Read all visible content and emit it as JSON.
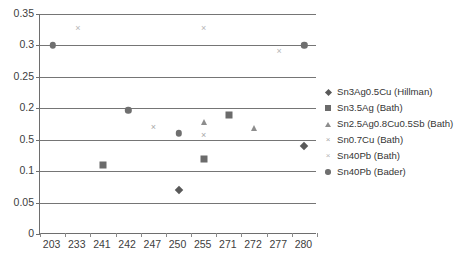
{
  "chart_data": {
    "type": "scatter",
    "title": "",
    "xlabel": "",
    "ylabel": "",
    "categories": [
      "203",
      "233",
      "241",
      "242",
      "247",
      "250",
      "255",
      "271",
      "272",
      "277",
      "280"
    ],
    "ylim": [
      0,
      0.35
    ],
    "ytick_labels": [
      "0.35",
      "0.3",
      "0.25",
      "0.2",
      "0.5",
      "0.1",
      "0.05",
      "0"
    ],
    "ytick_values": [
      0.35,
      0.3,
      0.25,
      0.2,
      0.15,
      0.1,
      0.05,
      0
    ],
    "grid": true,
    "legend_position": "right",
    "series": [
      {
        "name": "Sn3Ag0.5Cu (Hillman)",
        "marker": "diamond",
        "color": "#595959",
        "points": [
          {
            "x": "250",
            "y": 0.07
          },
          {
            "x": "280",
            "y": 0.14
          }
        ]
      },
      {
        "name": "Sn3.5Ag (Bath)",
        "marker": "square",
        "color": "#6b6b6b",
        "points": [
          {
            "x": "241",
            "y": 0.11
          },
          {
            "x": "255",
            "y": 0.12
          },
          {
            "x": "271",
            "y": 0.189
          }
        ]
      },
      {
        "name": "Sn2.5Ag0.8Cu0.5Sb (Bath)",
        "marker": "triangle",
        "color": "#8d8d8d",
        "points": [
          {
            "x": "255",
            "y": 0.178
          },
          {
            "x": "272",
            "y": 0.168
          }
        ]
      },
      {
        "name": "Sn0.7Cu (Bath)",
        "marker": "cross",
        "color": "#a8a8a8",
        "points": [
          {
            "x": "247",
            "y": 0.171
          },
          {
            "x": "255",
            "y": 0.158
          }
        ]
      },
      {
        "name": "Sn40Pb (Bath)",
        "marker": "cross-light",
        "color": "#b5b5b5",
        "points": [
          {
            "x": "233",
            "y": 0.328
          },
          {
            "x": "255",
            "y": 0.328
          },
          {
            "x": "277",
            "y": 0.291
          }
        ]
      },
      {
        "name": "Sn40Pb (Bader)",
        "marker": "circle",
        "color": "#6f6f6f",
        "points": [
          {
            "x": "203",
            "y": 0.3
          },
          {
            "x": "242",
            "y": 0.197
          },
          {
            "x": "250",
            "y": 0.16
          },
          {
            "x": "280",
            "y": 0.3
          }
        ]
      }
    ]
  }
}
